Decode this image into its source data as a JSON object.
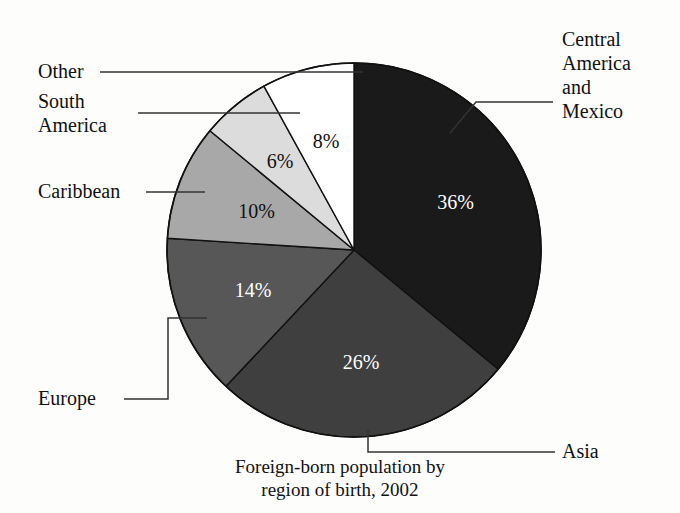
{
  "caption": {
    "line1": "Foreign-born population by",
    "line2": "region of birth, 2002"
  },
  "labels": {
    "other": "Other",
    "south_america_line1": "South",
    "south_america_line2": "America",
    "caribbean": "Caribbean",
    "europe": "Europe",
    "asia": "Asia",
    "central_america_line1": "Central",
    "central_america_line2": "America",
    "central_america_line3": "and",
    "central_america_line4": "Mexico"
  },
  "percent_labels": {
    "central_america": "36%",
    "asia": "26%",
    "europe": "14%",
    "caribbean": "10%",
    "south_america": "6%",
    "other": "8%"
  },
  "colors": {
    "central_america": "#1a1a1a",
    "asia": "#3f3f3f",
    "europe": "#575757",
    "caribbean": "#a8a8a8",
    "south_america": "#dcdcdc",
    "other": "#ffffff",
    "outline": "#111111",
    "background": "#fdfdfb",
    "text": "#111111",
    "leader_line": "#333333"
  },
  "chart_data": {
    "type": "pie",
    "title": "Foreign-born population by region of birth, 2002",
    "subtitle": "",
    "xlabel": "",
    "ylabel": "",
    "legend_position": "callout-labels",
    "grid": false,
    "start_angle_deg": 0,
    "direction": "clockwise",
    "categories": [
      "Central America and Mexico",
      "Asia",
      "Europe",
      "Caribbean",
      "South America",
      "Other"
    ],
    "values": [
      36,
      26,
      14,
      10,
      6,
      8
    ],
    "value_labels": [
      "36%",
      "26%",
      "14%",
      "10%",
      "6%",
      "8%"
    ],
    "units": "percent",
    "total": 100,
    "slice_colors": [
      "#1a1a1a",
      "#3f3f3f",
      "#575757",
      "#a8a8a8",
      "#dcdcdc",
      "#ffffff"
    ],
    "slice_label_colors": [
      "#ffffff",
      "#ffffff",
      "#ffffff",
      "#111111",
      "#111111",
      "#111111"
    ],
    "slices": [
      {
        "name": "Central America and Mexico",
        "value": 36,
        "label": "36%",
        "color": "#1a1a1a",
        "start_deg": 0,
        "end_deg": 129.6
      },
      {
        "name": "Asia",
        "value": 26,
        "label": "26%",
        "color": "#3f3f3f",
        "start_deg": 129.6,
        "end_deg": 223.2
      },
      {
        "name": "Europe",
        "value": 14,
        "label": "14%",
        "color": "#575757",
        "start_deg": 223.2,
        "end_deg": 273.6
      },
      {
        "name": "Caribbean",
        "value": 10,
        "label": "10%",
        "color": "#a8a8a8",
        "start_deg": 273.6,
        "end_deg": 309.6
      },
      {
        "name": "South America",
        "value": 6,
        "label": "6%",
        "color": "#dcdcdc",
        "start_deg": 309.6,
        "end_deg": 331.2
      },
      {
        "name": "Other",
        "value": 8,
        "label": "8%",
        "color": "#ffffff",
        "start_deg": 331.2,
        "end_deg": 360
      }
    ]
  }
}
